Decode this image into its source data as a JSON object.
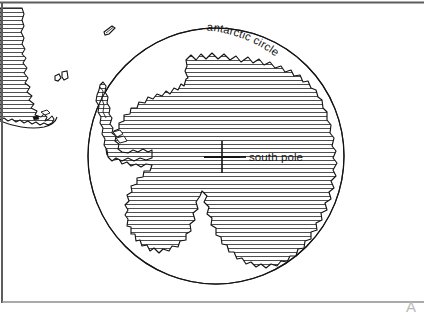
{
  "figure": {
    "kind": "line-art-map",
    "width": 424,
    "height": 314,
    "background_color": "#ffffff",
    "ink_color": "#141414",
    "hatch_color": "#2a2a2a",
    "frame_color": "#5d5d5d"
  },
  "labels": {
    "antarctic_circle": "antarctic circle",
    "south_pole": "south pole",
    "corner_glyph": "A"
  },
  "features": {
    "antarctic_circle_name": "antarctic-circle",
    "continent_name": "antarctica-landmass",
    "peninsula_name": "antarctic-peninsula",
    "south_america_name": "south-america-southern-tip",
    "island_north_name": "small-island-north",
    "island_pair_name": "falkland-islands",
    "pole_marker_name": "south-pole-cross-marker"
  },
  "geometry": {
    "circle_center_x": 216,
    "circle_center_y": 156,
    "circle_radius": 128,
    "pole_marker_x": 222,
    "pole_marker_y": 157,
    "pole_cross_half_width": 18,
    "pole_cross_half_height": 16,
    "leader_line_end_x": 243,
    "label_text_x": 246,
    "label_text_y": 161
  },
  "hatching": {
    "orientation": "horizontal",
    "spacing_px": 4,
    "stroke_width": 0.85
  }
}
